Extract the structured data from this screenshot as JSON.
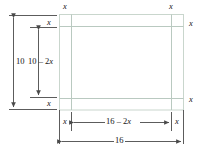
{
  "figure": {
    "kind": "geometry-diagram",
    "colors": {
      "sheet_stroke": "#c9d6cd",
      "fold_line": "#b9c9c0",
      "dimension_line": "#4a4a4a",
      "label_text": "#141414",
      "background": "#ffffff"
    },
    "sheet": {
      "outer_width_label": "16",
      "outer_height_label": "10",
      "corner_cut_label": "x",
      "inner_width_label": "16 – 2x",
      "inner_height_label": "10 – 2x"
    },
    "labels": {
      "corner_x": "x",
      "height_total": "10",
      "height_inner_a": "10 ",
      "height_inner_op": "– 2",
      "height_inner_b": "x",
      "width_total": "16",
      "width_inner_a": "16 ",
      "width_inner_op": "– 2",
      "width_inner_b": "x"
    },
    "corner_labels": {
      "top_left": "x",
      "top_right": "x",
      "right_top": "x",
      "right_bottom": "x",
      "left_top": "x",
      "left_bottom": "x",
      "bottom_left": "x",
      "bottom_right": "x"
    }
  }
}
